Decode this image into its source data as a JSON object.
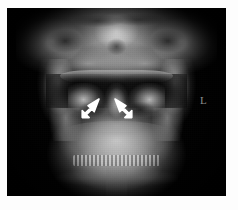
{
  "figure": {
    "name": "cervical-spine-ap-open-mouth-radiograph",
    "modality_label": "",
    "background_color": "#fdfdfd",
    "plate_color": "#000000"
  },
  "radiograph": {
    "view": "AP open-mouth (odontoid) view",
    "region": "craniocervical junction / upper cervical spine",
    "plate": {
      "x": 7,
      "y": 8,
      "width": 219,
      "height": 188
    }
  },
  "markers": {
    "laterality": {
      "label": "L",
      "color": "#8d8d8d",
      "x": 200,
      "y": 95
    }
  },
  "annotations": {
    "arrows": [
      {
        "name": "arrow-left",
        "label": "",
        "color": "#ffffff",
        "direction": "up-right",
        "x": 78,
        "y": 95
      },
      {
        "name": "arrow-right",
        "label": "",
        "color": "#ffffff",
        "direction": "up-left",
        "x": 110,
        "y": 95
      }
    ]
  },
  "anatomy_labels": {
    "skull_base": "",
    "open_mouth_air_gap": "",
    "c1_lateral_masses": "",
    "odontoid_process": "",
    "mandible_ramus_left": "",
    "mandible_ramus_right": "",
    "mandible_body": "",
    "tooth_row": "",
    "trachea": ""
  }
}
